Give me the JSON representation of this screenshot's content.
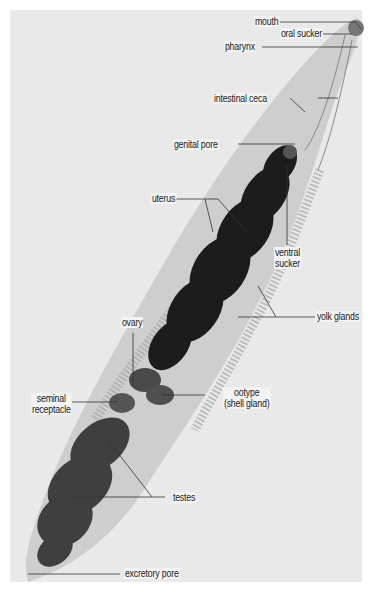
{
  "figure": {
    "background_color": "#ffffff",
    "photo_color": "#e9e9e9",
    "body_color": "#c9c9c9",
    "uterus_color": "#1c1c1c",
    "testes_color": "#3f3f3f",
    "line_color": "#333333"
  },
  "labels": {
    "mouth": "mouth",
    "oral_sucker": "oral sucker",
    "pharynx": "pharynx",
    "intestinal_ceca": "intestinal ceca",
    "genital_pore": "genital pore",
    "uterus": "uterus",
    "ventral_sucker_1": "ventral",
    "ventral_sucker_2": "sucker",
    "yolk_glands": "yolk glands",
    "ovary": "ovary",
    "seminal_receptacle_1": "seminal",
    "seminal_receptacle_2": "receptacle",
    "ootype_1": "ootype",
    "ootype_2": "(shell gland)",
    "testes": "testes",
    "excretory_pore": "excretory pore"
  }
}
